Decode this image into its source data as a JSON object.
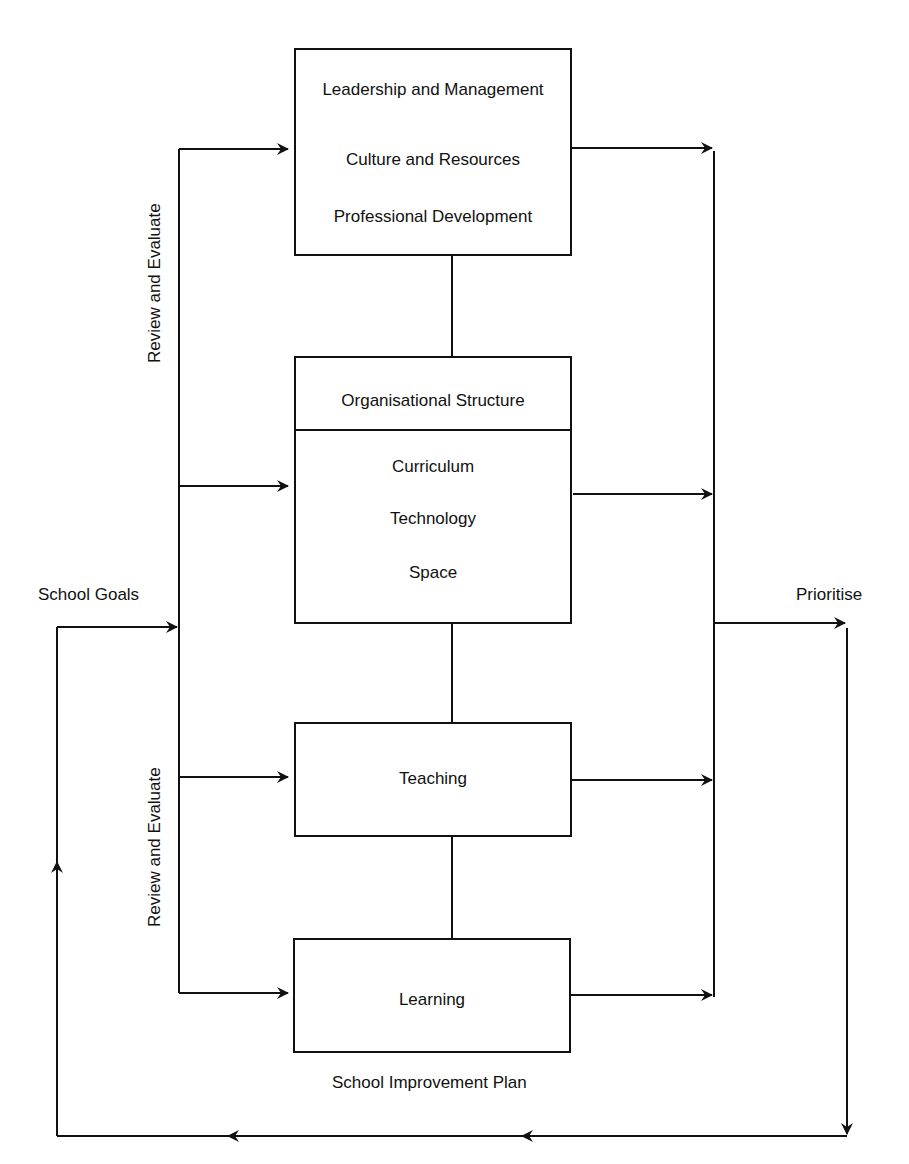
{
  "boxes": {
    "leadership": {
      "items": [
        "Leadership and Management",
        "Culture and Resources",
        "Professional Development"
      ]
    },
    "organisation": {
      "header": "Organisational Structure",
      "items": [
        "Curriculum",
        "Technology",
        "Space"
      ]
    },
    "teaching": {
      "label": "Teaching"
    },
    "learning": {
      "label": "Learning"
    }
  },
  "labels": {
    "school_goals": "School Goals",
    "prioritise": "Prioritise",
    "review_upper": "Review and Evaluate",
    "review_lower": "Review and Evaluate",
    "school_improvement_plan": "School Improvement Plan"
  },
  "colors": {
    "line": "#111111",
    "background": "#ffffff"
  }
}
